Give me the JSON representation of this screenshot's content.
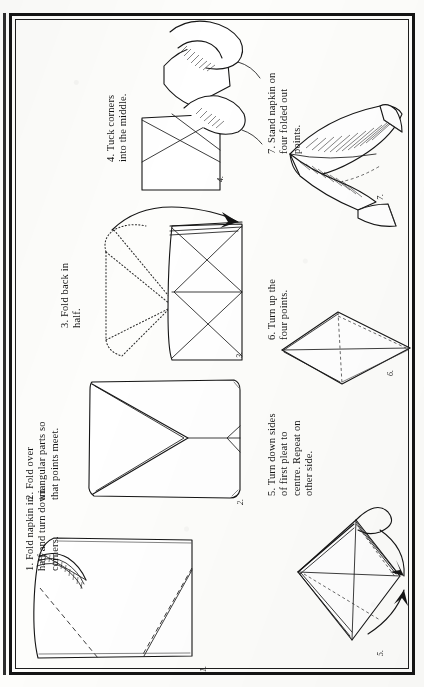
{
  "page": {
    "orientation": "text rotated 90 degrees counter-clockwise (sideways page)",
    "border_style": "double ruled rectangular frame",
    "ink_color": "#151515",
    "paper_color": "#fdfdfb"
  },
  "steps": [
    {
      "number": "1.",
      "figure_label": "1.",
      "caption": "1. Fold napkin in\nhalf and turn down\ncorners.",
      "lines": [
        "1. Fold napkin in",
        "half and turn down",
        "corners."
      ]
    },
    {
      "number": "2.",
      "figure_label": "2.",
      "caption": "2. Fold over\ntriangular parts so\nthat points meet.",
      "lines": [
        "2. Fold over",
        "triangular parts so",
        "that points meet."
      ]
    },
    {
      "number": "3.",
      "figure_label": "3.",
      "caption": "3. Fold back in\nhalf.",
      "lines": [
        "3. Fold back in",
        "half."
      ]
    },
    {
      "number": "4.",
      "figure_label": "4.",
      "caption": "4. Tuck corners\ninto the middle.",
      "lines": [
        "4. Tuck corners",
        "into the middle."
      ]
    },
    {
      "number": "5.",
      "figure_label": "5.",
      "caption": "5. Turn down sides\nof first pleat to\ncentre. Repeat on\nother side.",
      "lines": [
        "5. Turn down sides",
        "of first pleat to",
        "centre. Repeat on",
        "other side."
      ]
    },
    {
      "number": "6.",
      "figure_label": "6.",
      "caption": "6. Turn up the\nfour points.",
      "lines": [
        "6. Turn up the",
        "four points."
      ]
    },
    {
      "number": "7.",
      "figure_label": "7.",
      "caption": "7. Stand napkin on\nfour folded out\npoints.",
      "lines": [
        "7. Stand napkin on",
        "four folded out",
        "points."
      ]
    }
  ]
}
